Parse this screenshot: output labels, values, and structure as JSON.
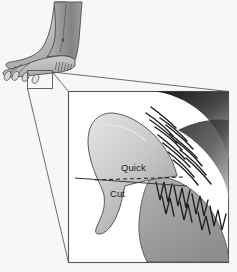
{
  "figure": {
    "background_color": "#f7f7f7"
  },
  "overview": {
    "name": "dog-leg-and-paw-overview",
    "description": "Side view of a dog hind leg and paw with claws",
    "leg_color_dark": "#8a8a8a",
    "leg_color_mid": "#a6a6a6",
    "paw_color_light": "#c9c9c9",
    "outline_color": "#3c3c3c"
  },
  "callout": {
    "name": "magnifier-callout",
    "source_box": {
      "x": 27,
      "y": 70,
      "width": 25,
      "height": 18
    },
    "target_box": {
      "x": 68,
      "y": 91,
      "width": 161,
      "height": 172
    },
    "line_color": "#4a4a4a",
    "border_color": "#555555"
  },
  "detail": {
    "name": "magnified-claw-detail",
    "claw_color_light": "#d3d3d3",
    "claw_color_mid": "#a8a8a8",
    "fur_color_dark": "#262626",
    "pad_color": "#9e9e9e",
    "quick_line_style": "dashed",
    "cut_line_style": "solid"
  },
  "labels": {
    "quick": "Quick",
    "cut": "Cut"
  }
}
